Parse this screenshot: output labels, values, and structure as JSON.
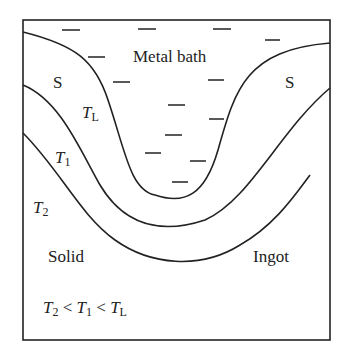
{
  "diagram": {
    "labels": {
      "metal_bath": "Metal bath",
      "s_left": "S",
      "s_right": "S",
      "tl": "T",
      "tl_sub": "L",
      "t1": "T",
      "t1_sub": "1",
      "t2": "T",
      "t2_sub": "2",
      "solid": "Solid",
      "ingot": "Ingot"
    },
    "relation": {
      "a": "T",
      "a_sub": "2",
      "lt1": " < ",
      "b": "T",
      "b_sub": "1",
      "lt2": " < ",
      "c": "T",
      "c_sub": "L"
    },
    "isotherms": [
      "T_L",
      "T_1",
      "T_2"
    ],
    "colors": {
      "line": "#222222",
      "background": "#ffffff"
    }
  }
}
